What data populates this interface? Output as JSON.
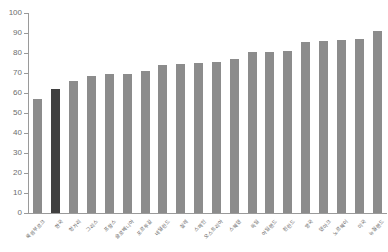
{
  "chart_data": {
    "type": "bar",
    "title": "",
    "subtitle": "",
    "xlabel": "",
    "ylabel": "",
    "ylim": [
      0,
      100
    ],
    "ytick_step": 10,
    "grid": false,
    "legend": null,
    "categories": [
      "룩셈부르크",
      "한국",
      "헝가리",
      "그리스",
      "프랑스",
      "슬로베니아",
      "포르투갈",
      "네덜란드",
      "칠레",
      "스페인",
      "오스트리아",
      "스웨덴",
      "독일",
      "아일랜드",
      "핀란드",
      "영국",
      "덴마크",
      "노르웨이",
      "미국",
      "뉴질랜드"
    ],
    "values": [
      57,
      62,
      66,
      68.5,
      69.5,
      69.5,
      71,
      74,
      74.5,
      75,
      75.5,
      77,
      80.5,
      80.5,
      81,
      85.5,
      86,
      86.5,
      87,
      91
    ],
    "ytick_labels": [
      "0",
      "10",
      "20",
      "30",
      "40",
      "50",
      "60",
      "70",
      "80",
      "90",
      "100"
    ],
    "highlight_index": 1,
    "colors": {
      "bar": "#8c8c8c",
      "highlight_bar": "#404040",
      "axis": "#9a9a9a",
      "tick_text": "#6d6d6d",
      "category_text": "#5e5e5e",
      "background": "#ffffff"
    }
  }
}
